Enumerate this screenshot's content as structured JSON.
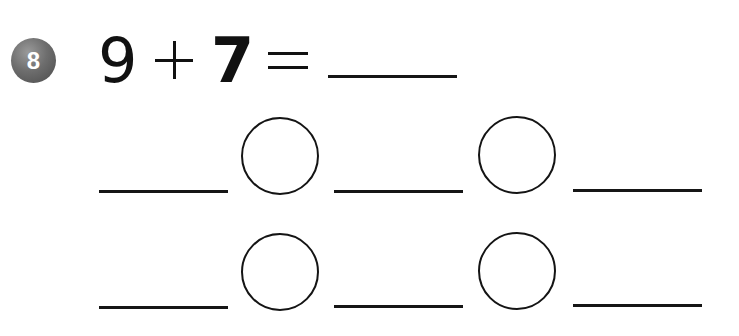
{
  "problem": {
    "number": "8",
    "operand_a": "9",
    "operator": "+",
    "operand_b": "7",
    "equals": "=",
    "answer": ""
  },
  "strategy_rows": [
    {
      "blanks": [
        "",
        "",
        ""
      ],
      "operator_circles": [
        "",
        ""
      ]
    },
    {
      "blanks": [
        "",
        "",
        ""
      ],
      "operator_circles": [
        "",
        ""
      ]
    }
  ],
  "colors": {
    "badge": "#6e6e6e",
    "badge_text": "#ffffff",
    "ink": "#111111",
    "background": "#ffffff"
  }
}
